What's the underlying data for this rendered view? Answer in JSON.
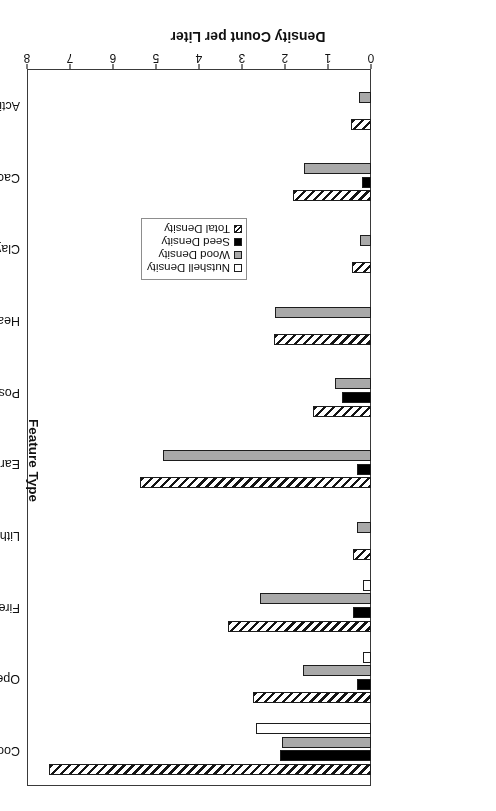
{
  "chart_data": {
    "type": "bar",
    "orientation": "horizontal",
    "title": "",
    "xlabel": "Density Count per Liter",
    "ylabel": "Feature Type",
    "xlim": [
      0,
      8
    ],
    "xticks": [
      "0",
      "1",
      "2",
      "3",
      "4",
      "5",
      "6",
      "7",
      "8"
    ],
    "grid": false,
    "legend_position": "center-left",
    "rotated_180": true,
    "categories": [
      "Cooking/Refuse",
      "Open Basin",
      "Fire Stain",
      "Lithic Dump",
      "Earth Oven",
      "Postmold",
      "Hearth",
      "Clay Dump",
      "Cache",
      "Activity Area"
    ],
    "series": [
      {
        "name": "Nutshell Density",
        "fill": "white",
        "values": [
          2.67,
          0.19,
          0.19,
          0.0,
          0.0,
          0.0,
          0.0,
          0.0,
          0.0,
          0.0
        ]
      },
      {
        "name": "Wood Density",
        "fill": "gray",
        "values": [
          2.07,
          1.58,
          2.58,
          0.33,
          4.84,
          0.84,
          2.23,
          0.26,
          1.56,
          0.28
        ]
      },
      {
        "name": "Seed Density",
        "fill": "black",
        "values": [
          2.12,
          0.33,
          0.42,
          0.0,
          0.33,
          0.67,
          0.0,
          0.0,
          0.21,
          0.0
        ]
      },
      {
        "name": "Total Density",
        "fill": "hatched",
        "values": [
          7.49,
          2.74,
          3.33,
          0.42,
          5.37,
          1.35,
          2.26,
          0.44,
          1.81,
          0.47
        ]
      }
    ]
  },
  "legend": {
    "items": [
      {
        "label": "Nutshell Density",
        "swatch": "white"
      },
      {
        "label": "Wood Density",
        "swatch": "gray"
      },
      {
        "label": "Seed Density",
        "swatch": "black"
      },
      {
        "label": "Total Density",
        "swatch": "hatched"
      }
    ]
  },
  "axes": {
    "value_axis_title": "Density Count per Liter",
    "category_axis_title": "Feature Type"
  }
}
